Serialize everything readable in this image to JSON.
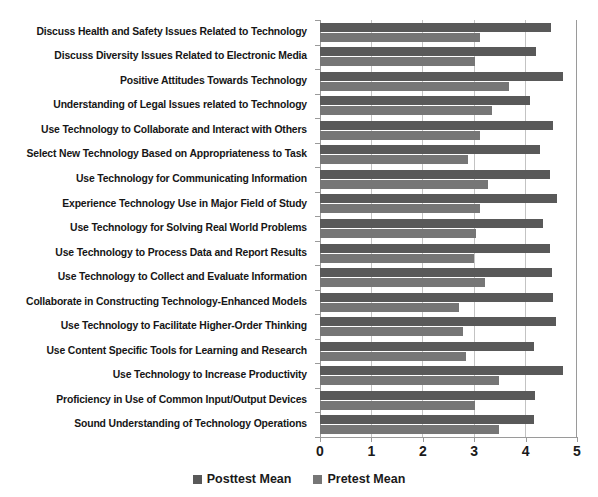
{
  "chart_data": {
    "type": "bar",
    "orientation": "horizontal",
    "title": "",
    "xlabel": "",
    "ylabel": "",
    "xlim": [
      0,
      5
    ],
    "xticks": [
      0,
      1,
      2,
      3,
      4,
      5
    ],
    "xtick_labels": [
      "0",
      "1",
      "2",
      "3",
      "4",
      "5"
    ],
    "grid": true,
    "legend_position": "bottom",
    "categories": [
      "Discuss Health and Safety Issues Related to Technology",
      "Discuss Diversity Issues Related to Electronic Media",
      "Positive Attitudes Towards Technology",
      "Understanding of Legal Issues related to Technology",
      "Use Technology to Collaborate and Interact with Others",
      "Select New Technology Based on Appropriateness to Task",
      "Use Technology for Communicating Information",
      "Experience Technology Use in Major Field of Study",
      "Use Technology for Solving Real World Problems",
      "Use Technology to Process Data and Report Results",
      "Use Technology to Collect and Evaluate Information",
      "Collaborate in Constructing Technology-Enhanced Models",
      "Use Technology to Facilitate Higher-Order Thinking",
      "Use Content Specific Tools for Learning and Research",
      "Use Technology to Increase Productivity",
      "Proficiency in Use of Common Input/Output Devices",
      "Sound Understanding of Technology Operations"
    ],
    "series": [
      {
        "name": "Posttest Mean",
        "color": "#595959",
        "values": [
          4.52,
          4.22,
          4.75,
          4.1,
          4.55,
          4.3,
          4.5,
          4.63,
          4.35,
          4.5,
          4.53,
          4.55,
          4.6,
          4.18,
          4.75,
          4.2,
          4.18
        ]
      },
      {
        "name": "Pretest Mean",
        "color": "#767676",
        "values": [
          3.12,
          3.03,
          3.7,
          3.35,
          3.13,
          2.9,
          3.28,
          3.12,
          3.05,
          3.0,
          3.23,
          2.72,
          2.8,
          2.85,
          3.5,
          3.02,
          3.5
        ]
      }
    ]
  },
  "legend": {
    "items": [
      {
        "label": "Posttest Mean",
        "swatch": "post"
      },
      {
        "label": "Pretest Mean",
        "swatch": "pre"
      }
    ]
  }
}
